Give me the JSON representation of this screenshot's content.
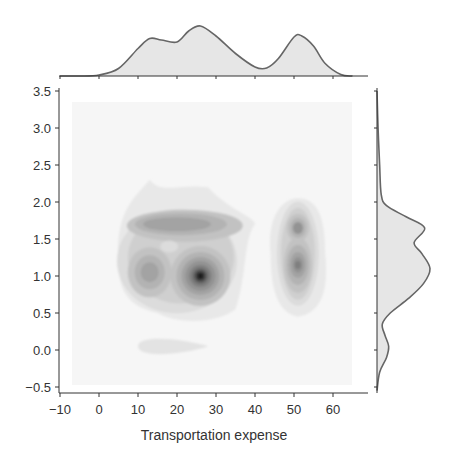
{
  "chart_data": {
    "type": "jointplot-kde",
    "title": "",
    "xlabel": "Transportation expense",
    "ylabel": "",
    "xlim": [
      -11,
      68
    ],
    "ylim": [
      -0.65,
      3.55
    ],
    "x_ticks": [
      -10,
      0,
      10,
      20,
      30,
      40,
      50,
      60
    ],
    "x_tick_labels": [
      "−10",
      "0",
      "10",
      "20",
      "30",
      "40",
      "50",
      "60"
    ],
    "y_ticks": [
      -0.5,
      0.0,
      0.5,
      1.0,
      1.5,
      2.0,
      2.5,
      3.0,
      3.5
    ],
    "y_tick_labels": [
      "−0.5",
      "0.0",
      "0.5",
      "1.0",
      "1.5",
      "2.0",
      "2.5",
      "3.0",
      "3.5"
    ],
    "grid": false,
    "legend": null,
    "colormap": "Greys",
    "joint_kde_modes": [
      {
        "x": 26,
        "y": 1.0,
        "density": 1.0,
        "label": "dominant peak"
      },
      {
        "x": 13,
        "y": 1.05,
        "density": 0.55
      },
      {
        "x": 20,
        "y": 1.7,
        "density": 0.6,
        "note": "elongated ridge from x~12 to x~30"
      },
      {
        "x": 51,
        "y": 1.15,
        "density": 0.6
      },
      {
        "x": 51,
        "y": 1.65,
        "density": 0.5
      },
      {
        "x": 17,
        "y": 0.05,
        "density": 0.15,
        "note": "faint low blob"
      }
    ],
    "marginal_x": {
      "type": "kde",
      "x": [
        -10,
        -5,
        0,
        5,
        10,
        13,
        16,
        20,
        23,
        26,
        30,
        35,
        40,
        43,
        46,
        50,
        52,
        55,
        58,
        62,
        65
      ],
      "density": [
        0.0,
        0.0,
        0.02,
        0.15,
        0.55,
        0.75,
        0.72,
        0.68,
        0.9,
        1.0,
        0.8,
        0.45,
        0.18,
        0.16,
        0.35,
        0.78,
        0.8,
        0.6,
        0.25,
        0.03,
        0.0
      ]
    },
    "marginal_y": {
      "type": "kde",
      "y": [
        -0.55,
        -0.3,
        -0.1,
        0.05,
        0.2,
        0.35,
        0.5,
        0.7,
        0.9,
        1.1,
        1.3,
        1.45,
        1.65,
        1.8,
        1.95,
        2.1,
        2.5,
        3.0,
        3.5
      ],
      "density": [
        0.0,
        0.05,
        0.18,
        0.22,
        0.15,
        0.1,
        0.25,
        0.6,
        0.88,
        1.0,
        0.85,
        0.7,
        0.9,
        0.55,
        0.18,
        0.08,
        0.05,
        0.02,
        0.0
      ]
    }
  },
  "style": {
    "fill_light": "#e6e6e6",
    "line_color": "#666666",
    "axis_color": "#333333",
    "background_box": "#f7f7f7"
  }
}
